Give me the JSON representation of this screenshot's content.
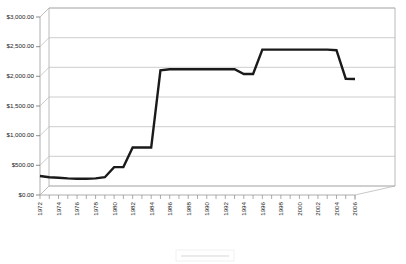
{
  "chart_data": {
    "type": "line",
    "title": "",
    "subtitle": "",
    "xlabel": "",
    "ylabel": "",
    "ylim": [
      0,
      3000
    ],
    "ytick_step": 500,
    "grid": true,
    "legend_position": "bottom",
    "style": "3d-perspective-step-line",
    "ytick_labels": [
      "$3,000.00",
      "$2,500.00",
      "$2,000.00",
      "$1,500.00",
      "$1,000.00",
      "$500.00",
      "$0.00"
    ],
    "ytick_values": [
      3000,
      2500,
      2000,
      1500,
      1000,
      500,
      0
    ],
    "xtick_labels_shown": [
      "1972",
      "1974",
      "1976",
      "1978",
      "1980",
      "1982",
      "1984",
      "1986",
      "1988",
      "1990",
      "1992",
      "1994",
      "1996",
      "1998",
      "2000",
      "2002",
      "2004",
      "2006"
    ],
    "x": [
      1972,
      1973,
      1974,
      1975,
      1976,
      1977,
      1978,
      1979,
      1980,
      1981,
      1982,
      1983,
      1984,
      1985,
      1986,
      1987,
      1988,
      1989,
      1990,
      1991,
      1992,
      1993,
      1994,
      1995,
      1996,
      1997,
      1998,
      1999,
      2000,
      2001,
      2002,
      2003,
      2004,
      2005,
      2006
    ],
    "series": [
      {
        "name": "Series 1",
        "values": [
          320,
          300,
          290,
          280,
          275,
          275,
          280,
          300,
          470,
          470,
          800,
          800,
          800,
          2100,
          2120,
          2120,
          2120,
          2120,
          2120,
          2120,
          2120,
          2120,
          2040,
          2040,
          2450,
          2450,
          2450,
          2450,
          2450,
          2450,
          2450,
          2450,
          2440,
          1960,
          1955
        ]
      }
    ],
    "legend_entries": [
      "Series 1"
    ]
  },
  "colors": {
    "series_line": "#1a1a1a",
    "grid": "#b8b8b8",
    "axis": "#9a9a9a",
    "background": "#ffffff",
    "label_text": "#1c1c1c"
  }
}
